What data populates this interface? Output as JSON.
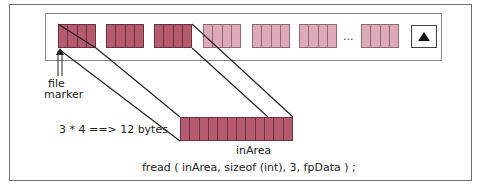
{
  "diagram": {
    "file_blocks": [
      {
        "shade": "dark"
      },
      {
        "shade": "dark"
      },
      {
        "shade": "dark"
      },
      {
        "shade": "light"
      },
      {
        "shade": "light"
      },
      {
        "shade": "light"
      },
      {
        "shade": "light"
      }
    ],
    "cells_per_block": 4,
    "ellipsis": "...",
    "eof_marker": "▲",
    "file_marker_label_line1": "file",
    "file_marker_label_line2": "marker",
    "bytes_label": "3 * 4 ==> 12 bytes",
    "buffer_label": "inArea",
    "buffer_cells": 12,
    "code_line": "fread ( inArea, sizeof (int), 3, fpData ) ;",
    "colors": {
      "read_block": "#b65a6e",
      "unread_block": "#dfaab7",
      "outline": "#6a3344"
    }
  }
}
